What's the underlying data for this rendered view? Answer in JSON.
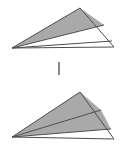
{
  "figure": {
    "canvas": {
      "width": 124,
      "height": 149
    },
    "background_color": "#ffffff",
    "stroke_color": "#4d4d4d",
    "shaded_color": "#a9a9a9",
    "unshaded_color": "#ffffff",
    "divider_color": "#8a8a8a",
    "panels": [
      {
        "name": "top-triangle",
        "label": "Top triangle",
        "apex_top": {
          "x": 80,
          "y": 8
        },
        "vertex_left": {
          "x": 12,
          "y": 48
        },
        "vertex_right": {
          "x": 114,
          "y": 47
        },
        "cevians": [
          {
            "name": "cevian-1",
            "from": {
              "x": 12,
              "y": 48
            },
            "to": {
              "x": 104,
              "y": 25
            }
          },
          {
            "name": "cevian-2",
            "from": {
              "x": 12,
              "y": 48
            },
            "to": {
              "x": 112,
              "y": 41
            }
          }
        ],
        "regions": [
          {
            "name": "region-upper",
            "shaded": true,
            "fill": "#a9a9a9",
            "points": "80,8 104,25 12,48"
          },
          {
            "name": "region-middle",
            "shaded": false,
            "fill": "#ffffff",
            "points": "104,25 112,41 12,48"
          },
          {
            "name": "region-lower",
            "shaded": false,
            "fill": "#ffffff",
            "points": "112,41 114,47 12,48"
          }
        ],
        "shaded_count": 1,
        "region_count": 3
      },
      {
        "name": "bottom-triangle",
        "label": "Bottom triangle",
        "apex_top": {
          "x": 80,
          "y": 92
        },
        "vertex_left": {
          "x": 12,
          "y": 137
        },
        "vertex_right": {
          "x": 114,
          "y": 139
        },
        "cevians": [
          {
            "name": "cevian-1",
            "from": {
              "x": 12,
              "y": 137
            },
            "to": {
              "x": 101,
              "y": 110
            }
          },
          {
            "name": "cevian-2",
            "from": {
              "x": 12,
              "y": 137
            },
            "to": {
              "x": 111,
              "y": 129
            }
          }
        ],
        "regions": [
          {
            "name": "region-upper",
            "shaded": true,
            "fill": "#a9a9a9",
            "points": "80,92 101,110 12,137"
          },
          {
            "name": "region-middle",
            "shaded": true,
            "fill": "#a9a9a9",
            "points": "101,110 111,129 12,137"
          },
          {
            "name": "region-lower",
            "shaded": false,
            "fill": "#ffffff",
            "points": "111,129 114,139 12,137"
          }
        ],
        "shaded_count": 2,
        "region_count": 3
      }
    ],
    "divider": {
      "name": "panel-divider-tick",
      "shape": "vertical-bar",
      "x": 58,
      "y": 62,
      "width": 2,
      "height": 13,
      "color": "#8a8a8a"
    }
  }
}
